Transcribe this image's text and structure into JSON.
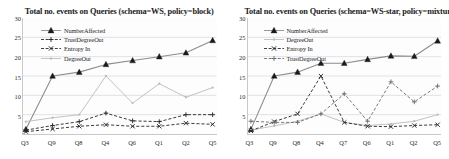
{
  "figure": {
    "width": 449,
    "height": 159,
    "panel_count": 2
  },
  "chart_data": [
    {
      "type": "line",
      "title": "Total no. events on Queries (schema=WS, policy=block)",
      "xlabel": "",
      "ylabel": "",
      "categories": [
        "Q3",
        "Q9",
        "Q8",
        "Q4",
        "Q6",
        "Q1",
        "Q2",
        "Q5"
      ],
      "ylim": [
        0,
        30
      ],
      "yticks": [
        5,
        10,
        15,
        20,
        25,
        30
      ],
      "grid": true,
      "legend_position": "top-left",
      "series": [
        {
          "name": "NumberAffected",
          "marker": "triangle",
          "line": "solid",
          "color": "#8c8c8c",
          "values": [
            1.2,
            15.0,
            16.0,
            18.0,
            19.0,
            20.0,
            21.0,
            24.2
          ]
        },
        {
          "name": "TrustDegreeOut",
          "marker": "plus",
          "line": "dashed",
          "color": "#2b2b2b",
          "values": [
            1.0,
            2.2,
            3.2,
            5.4,
            3.4,
            3.2,
            5.0,
            5.0
          ]
        },
        {
          "name": "Entropy In",
          "marker": "cross",
          "line": "dashed",
          "color": "#2b2b2b",
          "values": [
            0.6,
            1.3,
            2.0,
            2.4,
            2.0,
            2.0,
            2.8,
            2.5
          ]
        },
        {
          "name": "DegreeOut",
          "marker": "dot",
          "line": "solid",
          "color": "#bdbdbd",
          "values": [
            3.2,
            4.2,
            5.0,
            15.0,
            8.0,
            13.0,
            9.5,
            12.0
          ]
        }
      ]
    },
    {
      "type": "line",
      "title": "Total no. events on Queries (schema=WS-star, policy=mixture)",
      "xlabel": "",
      "ylabel": "",
      "categories": [
        "Q3",
        "Q9",
        "Q8",
        "Q4",
        "Q7",
        "Q6",
        "Q1",
        "Q2",
        "Q5"
      ],
      "ylim": [
        0,
        30
      ],
      "yticks": [
        5,
        10,
        15,
        20,
        25,
        30
      ],
      "grid": true,
      "legend_position": "top-left",
      "series": [
        {
          "name": "NumberAffected",
          "marker": "triangle",
          "line": "solid",
          "color": "#8c8c8c",
          "values": [
            1.2,
            15.0,
            16.0,
            18.3,
            18.3,
            19.3,
            20.2,
            20.1,
            24.1
          ]
        },
        {
          "name": "DegreeOut",
          "marker": "dot",
          "line": "solid",
          "color": "#bdbdbd",
          "values": [
            1.0,
            2.1,
            3.3,
            5.2,
            3.0,
            2.2,
            2.6,
            3.3,
            5.0
          ]
        },
        {
          "name": "Entropy In",
          "marker": "cross",
          "line": "dashed",
          "color": "#2b2b2b",
          "values": [
            0.8,
            3.2,
            5.2,
            15.0,
            3.0,
            2.0,
            1.9,
            2.2,
            2.4
          ]
        },
        {
          "name": "TrustDegreeOut",
          "marker": "plus",
          "line": "dashed",
          "color": "#6e6e6e",
          "values": [
            3.3,
            3.0,
            3.0,
            5.2,
            10.4,
            3.3,
            13.5,
            8.3,
            12.4
          ]
        }
      ]
    }
  ]
}
